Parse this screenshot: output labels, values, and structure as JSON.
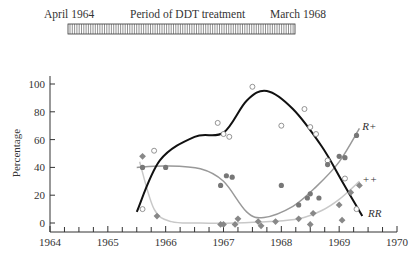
{
  "treatment_bar": {
    "start_label": "April 1964",
    "title": "Period of DDT treatment",
    "end_label": "March 1968"
  },
  "chart_data": {
    "type": "scatter",
    "title": "",
    "xlabel": "",
    "ylabel": "Percentage",
    "xlim": [
      1964,
      1970
    ],
    "ylim": [
      0,
      100
    ],
    "x_ticks": [
      "1964",
      "1965",
      "1966",
      "1967",
      "1968",
      "1969",
      "1970"
    ],
    "y_ticks": [
      "0",
      "20",
      "40",
      "60",
      "80",
      "100"
    ],
    "grid": false,
    "legend_position": "inline labels at right end of curves",
    "series": [
      {
        "name": "RR",
        "marker": "open circle",
        "curve_color": "#111111",
        "points": [
          [
            1965.6,
            10
          ],
          [
            1965.8,
            52
          ],
          [
            1966.9,
            72
          ],
          [
            1967.0,
            64
          ],
          [
            1967.1,
            62
          ],
          [
            1967.5,
            98
          ],
          [
            1968.0,
            70
          ],
          [
            1968.4,
            82
          ],
          [
            1968.5,
            69
          ],
          [
            1968.6,
            64
          ],
          [
            1968.8,
            45
          ],
          [
            1969.1,
            32
          ],
          [
            1969.3,
            10
          ]
        ],
        "curve": [
          [
            1965.5,
            8
          ],
          [
            1965.9,
            45
          ],
          [
            1966.5,
            62
          ],
          [
            1967.0,
            65
          ],
          [
            1967.4,
            88
          ],
          [
            1967.75,
            95
          ],
          [
            1968.2,
            82
          ],
          [
            1968.7,
            55
          ],
          [
            1969.05,
            30
          ],
          [
            1969.4,
            5
          ]
        ]
      },
      {
        "name": "R+",
        "marker": "filled circle",
        "curve_color": "#999999",
        "points": [
          [
            1965.6,
            40
          ],
          [
            1966.0,
            40
          ],
          [
            1966.95,
            27
          ],
          [
            1967.05,
            34
          ],
          [
            1967.15,
            33
          ],
          [
            1968.0,
            27
          ],
          [
            1968.3,
            13
          ],
          [
            1968.45,
            18
          ],
          [
            1968.5,
            21
          ],
          [
            1968.65,
            18
          ],
          [
            1968.8,
            42
          ],
          [
            1969.0,
            48
          ],
          [
            1969.1,
            47
          ],
          [
            1969.3,
            63
          ]
        ],
        "curve": [
          [
            1965.5,
            40
          ],
          [
            1966.0,
            41
          ],
          [
            1966.6,
            39
          ],
          [
            1967.0,
            30
          ],
          [
            1967.4,
            8
          ],
          [
            1967.7,
            4
          ],
          [
            1968.2,
            12
          ],
          [
            1968.6,
            26
          ],
          [
            1969.0,
            44
          ],
          [
            1969.35,
            68
          ]
        ]
      },
      {
        "name": "++",
        "marker": "filled diamond",
        "curve_color": "#c8c8c8",
        "points": [
          [
            1965.6,
            48
          ],
          [
            1965.85,
            5
          ],
          [
            1966.95,
            -1
          ],
          [
            1967.0,
            -1
          ],
          [
            1967.2,
            -1
          ],
          [
            1967.25,
            3
          ],
          [
            1967.6,
            1
          ],
          [
            1967.65,
            -2
          ],
          [
            1967.9,
            1
          ],
          [
            1968.3,
            3
          ],
          [
            1968.55,
            7
          ],
          [
            1968.5,
            -1
          ],
          [
            1969.0,
            13
          ],
          [
            1969.05,
            2
          ],
          [
            1969.2,
            22
          ],
          [
            1969.35,
            27
          ]
        ],
        "curve": [
          [
            1965.55,
            44
          ],
          [
            1965.8,
            10
          ],
          [
            1966.1,
            1
          ],
          [
            1966.6,
            0
          ],
          [
            1967.2,
            0
          ],
          [
            1967.8,
            1
          ],
          [
            1968.3,
            3
          ],
          [
            1968.7,
            9
          ],
          [
            1969.0,
            17
          ],
          [
            1969.35,
            30
          ]
        ]
      }
    ],
    "annotations": [
      {
        "text": "R+",
        "x": 1969.4,
        "y": 70
      },
      {
        "text": "++",
        "x": 1969.4,
        "y": 32
      },
      {
        "text": "RR",
        "x": 1969.5,
        "y": 7
      }
    ],
    "treatment_period": {
      "start": "April 1964",
      "end": "March 1968"
    }
  }
}
